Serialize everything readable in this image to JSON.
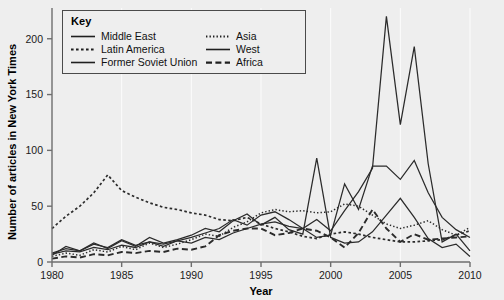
{
  "legend": {
    "title": "Key",
    "entries": [
      {
        "label": "Middle East",
        "style": "solid",
        "col": 0
      },
      {
        "label": "Asia",
        "style": "dotted",
        "col": 1
      },
      {
        "label": "Latin America",
        "style": "dotted-coarse",
        "col": 0
      },
      {
        "label": "West",
        "style": "solid",
        "col": 1
      },
      {
        "label": "Former Soviet Union",
        "style": "solid",
        "col": 0
      },
      {
        "label": "Africa",
        "style": "dashed",
        "col": 1
      }
    ]
  },
  "chart_data": {
    "type": "line",
    "title": "",
    "xlabel": "Year",
    "ylabel": "Number of articles in New York Times",
    "xlim": [
      1980,
      2010
    ],
    "ylim": [
      0,
      215
    ],
    "xticks": [
      1980,
      1985,
      1990,
      1995,
      2000,
      2005,
      2010
    ],
    "yticks": [
      0,
      50,
      100,
      150,
      200
    ],
    "grid": "vertical-only",
    "legend_position": "top-left",
    "x": [
      1980,
      1981,
      1982,
      1983,
      1984,
      1985,
      1986,
      1987,
      1988,
      1989,
      1990,
      1991,
      1992,
      1993,
      1994,
      1995,
      1996,
      1997,
      1998,
      1999,
      2000,
      2001,
      2002,
      2003,
      2004,
      2005,
      2006,
      2007,
      2008,
      2009,
      2010
    ],
    "series": [
      {
        "name": "Middle East",
        "style": "solid",
        "color": "#2b2b2b",
        "values": [
          8,
          12,
          10,
          16,
          13,
          20,
          15,
          18,
          14,
          19,
          17,
          22,
          20,
          26,
          30,
          34,
          36,
          32,
          30,
          38,
          28,
          46,
          63,
          84,
          220,
          123,
          193,
          88,
          18,
          25,
          10
        ]
      },
      {
        "name": "Latin America",
        "style": "dotted-coarse",
        "color": "#2b2b2b",
        "values": [
          30,
          41,
          50,
          62,
          78,
          64,
          58,
          53,
          49,
          47,
          44,
          42,
          38,
          37,
          40,
          34,
          30,
          27,
          23,
          21,
          25,
          27,
          25,
          22,
          20,
          18,
          18,
          19,
          20,
          24,
          28
        ]
      },
      {
        "name": "Former Soviet Union",
        "style": "solid",
        "color": "#2b2b2b",
        "values": [
          6,
          14,
          10,
          17,
          12,
          19,
          14,
          22,
          17,
          20,
          24,
          30,
          27,
          37,
          43,
          33,
          40,
          29,
          25,
          93,
          22,
          17,
          18,
          27,
          42,
          57,
          40,
          21,
          13,
          16,
          5
        ]
      },
      {
        "name": "Asia",
        "style": "dotted",
        "color": "#2b2b2b",
        "values": [
          5,
          8,
          6,
          11,
          9,
          14,
          11,
          17,
          13,
          16,
          20,
          25,
          23,
          31,
          36,
          44,
          47,
          45,
          46,
          44,
          45,
          52,
          50,
          42,
          34,
          30,
          33,
          37,
          29,
          24,
          31
        ]
      },
      {
        "name": "West",
        "style": "solid",
        "color": "#2b2b2b",
        "values": [
          7,
          10,
          9,
          13,
          11,
          15,
          13,
          18,
          16,
          19,
          22,
          26,
          30,
          38,
          33,
          42,
          45,
          38,
          30,
          22,
          24,
          70,
          47,
          86,
          86,
          74,
          91,
          62,
          40,
          29,
          22
        ]
      },
      {
        "name": "Africa",
        "style": "dashed",
        "color": "#2b2b2b",
        "values": [
          3,
          5,
          4,
          7,
          6,
          9,
          8,
          10,
          9,
          12,
          11,
          14,
          24,
          28,
          30,
          30,
          24,
          26,
          30,
          28,
          22,
          13,
          26,
          47,
          30,
          18,
          25,
          20,
          21,
          22,
          23
        ]
      }
    ]
  }
}
